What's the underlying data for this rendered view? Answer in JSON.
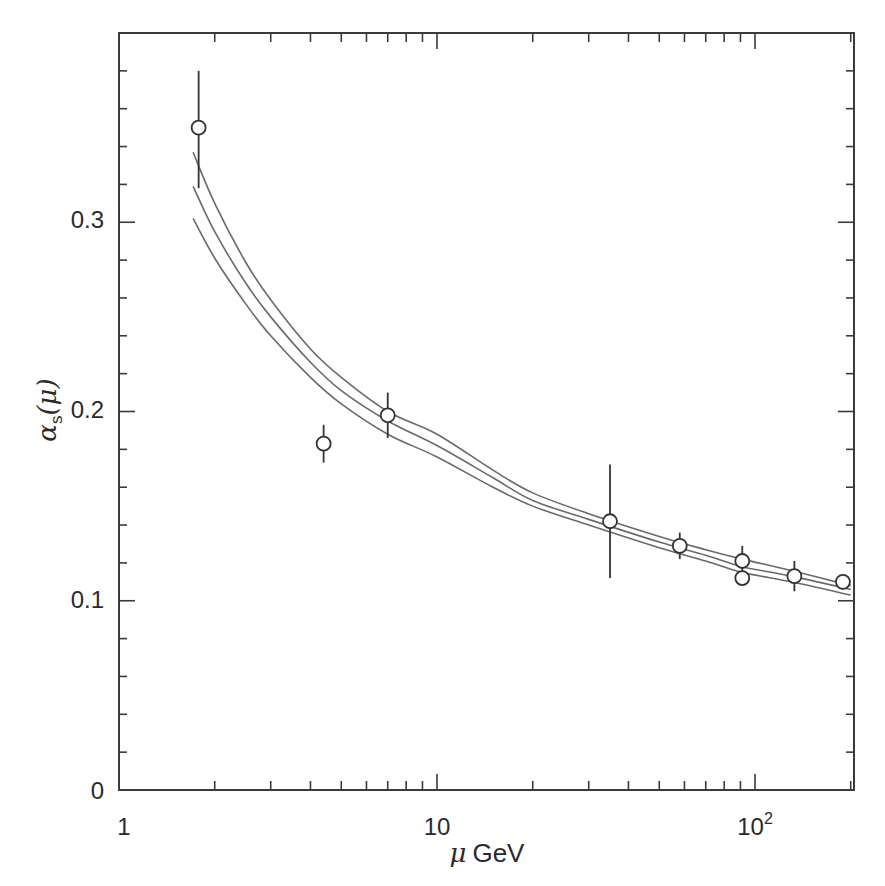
{
  "chart_data": {
    "type": "scatter",
    "title": "",
    "xlabel": "μ GeV",
    "ylabel": "αs(μ)",
    "xscale": "log",
    "xlim": [
      1,
      200
    ],
    "ylim": [
      0,
      0.4
    ],
    "x_tick_labels": [
      "1",
      "10",
      "10²"
    ],
    "x_ticks": [
      1,
      10,
      100
    ],
    "y_tick_labels": [
      "0",
      "0.1",
      "0.2",
      "0.3"
    ],
    "y_ticks": [
      0,
      0.1,
      0.2,
      0.3
    ],
    "y_minor_step": 0.02,
    "grid": false,
    "legend": null,
    "series": [
      {
        "name": "measurements",
        "marker": "open-circle",
        "points": [
          {
            "x": 1.78,
            "y": 0.35,
            "yerr_low": 0.032,
            "yerr_high": 0.03
          },
          {
            "x": 4.4,
            "y": 0.183,
            "yerr_low": 0.01,
            "yerr_high": 0.01
          },
          {
            "x": 7.0,
            "y": 0.198,
            "yerr_low": 0.012,
            "yerr_high": 0.012
          },
          {
            "x": 35,
            "y": 0.142,
            "yerr_low": 0.03,
            "yerr_high": 0.03
          },
          {
            "x": 58,
            "y": 0.129,
            "yerr_low": 0.007,
            "yerr_high": 0.007
          },
          {
            "x": 91.2,
            "y": 0.121,
            "yerr_low": 0.006,
            "yerr_high": 0.008
          },
          {
            "x": 91.2,
            "y": 0.112,
            "yerr_low": 0.004,
            "yerr_high": 0.004
          },
          {
            "x": 133,
            "y": 0.113,
            "yerr_low": 0.008,
            "yerr_high": 0.008
          },
          {
            "x": 189,
            "y": 0.11,
            "yerr_low": 0.004,
            "yerr_high": 0.004
          }
        ]
      },
      {
        "name": "QCD upper band",
        "type": "line",
        "x": [
          1.71,
          2,
          2.5,
          3,
          4,
          5,
          7,
          10,
          15,
          20,
          30,
          50,
          70,
          91.2,
          130,
          200
        ],
        "values": [
          0.337,
          0.31,
          0.279,
          0.259,
          0.233,
          0.218,
          0.2,
          0.188,
          0.169,
          0.157,
          0.146,
          0.134,
          0.127,
          0.122,
          0.116,
          0.108
        ]
      },
      {
        "name": "QCD central",
        "type": "line",
        "x": [
          1.71,
          2,
          2.5,
          3,
          4,
          5,
          7,
          10,
          15,
          20,
          30,
          50,
          70,
          91.2,
          130,
          200
        ],
        "values": [
          0.319,
          0.295,
          0.268,
          0.25,
          0.226,
          0.211,
          0.195,
          0.182,
          0.165,
          0.153,
          0.143,
          0.131,
          0.124,
          0.118,
          0.113,
          0.106
        ]
      },
      {
        "name": "QCD lower band",
        "type": "line",
        "x": [
          1.71,
          2,
          2.5,
          3,
          4,
          5,
          7,
          10,
          15,
          20,
          30,
          50,
          70,
          91.2,
          130,
          200
        ],
        "values": [
          0.302,
          0.281,
          0.257,
          0.24,
          0.218,
          0.204,
          0.188,
          0.176,
          0.16,
          0.15,
          0.14,
          0.128,
          0.121,
          0.115,
          0.11,
          0.103
        ]
      }
    ]
  },
  "labels": {
    "x_axis_mu": "μ",
    "x_axis_unit": "GeV",
    "y_axis_alpha": "α",
    "y_axis_sub": "s",
    "y_axis_arg": "(μ)",
    "x_tick_1": "1",
    "x_tick_10": "10",
    "x_tick_100_base": "10",
    "x_tick_100_exp": "2",
    "y_tick_0": "0",
    "y_tick_01": "0.1",
    "y_tick_02": "0.2",
    "y_tick_03": "0.3"
  },
  "colors": {
    "axis": "#3a3a3a",
    "curve": "#6a6a6a",
    "marker": "#333333",
    "background": "#ffffff"
  }
}
